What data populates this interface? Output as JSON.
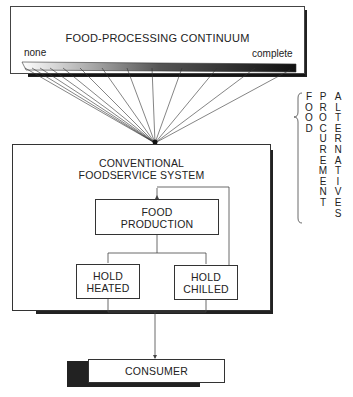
{
  "diagram": {
    "continuum": {
      "title": "FOOD-PROCESSING CONTINUUM",
      "left_label": "none",
      "right_label": "complete"
    },
    "side_label": {
      "columns": [
        "FOOD",
        "PROCUREMENT",
        "ALTERNATIVES"
      ],
      "brace": "{"
    },
    "system": {
      "title_line1": "CONVENTIONAL",
      "title_line2": "FOODSERVICE SYSTEM",
      "production": {
        "line1": "FOOD",
        "line2": "PRODUCTION"
      },
      "hold_heated": {
        "line1": "HOLD",
        "line2": "HEATED"
      },
      "hold_chilled": {
        "line1": "HOLD",
        "line2": "CHILLED"
      }
    },
    "consumer": {
      "label": "CONSUMER"
    }
  }
}
